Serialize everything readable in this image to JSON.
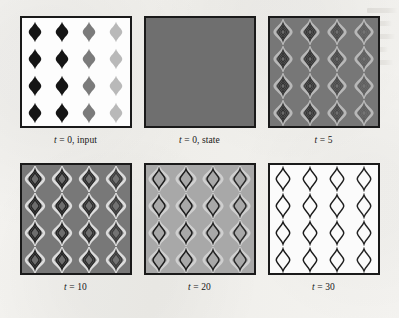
{
  "figure": {
    "kind": "simulation-frame-sequence",
    "grid_columns": 3,
    "grid_rows": 2,
    "cell_grid": {
      "rows": 4,
      "cols": 4
    },
    "page_background": "#f2f1ee",
    "frame_border_color": "#1a1a1a"
  },
  "panels": [
    {
      "id": "panel-t0-input",
      "caption_var": "t",
      "caption_rest": " = 0, input",
      "background": "#fdfdfd",
      "column_fills": [
        "#151515",
        "#151515",
        "#7b7b7b",
        "#b9b9b9"
      ],
      "column_strokes": [
        "#0d0d0d",
        "#0d0d0d",
        "#6e6e6e",
        "#b0b0b0"
      ],
      "halo": "none",
      "stroke_width": 0,
      "shape_scale": 1.0,
      "rings": 1,
      "blank": false
    },
    {
      "id": "panel-t0-state",
      "caption_var": "t",
      "caption_rest": " = 0, state",
      "background": "#6f6f6f",
      "column_fills": [
        "#6f6f6f",
        "#6f6f6f",
        "#6f6f6f",
        "#6f6f6f"
      ],
      "column_strokes": [
        "#6f6f6f",
        "#6f6f6f",
        "#6f6f6f",
        "#6f6f6f"
      ],
      "halo": "none",
      "stroke_width": 0,
      "shape_scale": 0,
      "rings": 0,
      "blank": true
    },
    {
      "id": "panel-t5",
      "caption_var": "t",
      "caption_rest": " = 5",
      "background": "#777777",
      "column_fills": [
        "#6a6a6a",
        "#6a6a6a",
        "#6f6f6f",
        "#747474"
      ],
      "column_strokes": [
        "#333333",
        "#333333",
        "#4a4a4a",
        "#5f5f5f"
      ],
      "halo": "#b8b8b8",
      "stroke_width": 1.1,
      "shape_scale": 0.86,
      "rings": 3,
      "blank": false
    },
    {
      "id": "panel-t10",
      "caption_var": "t",
      "caption_rest": " = 10",
      "background": "#787878",
      "column_fills": [
        "#6d6d6d",
        "#6d6d6d",
        "#6f6f6f",
        "#727272"
      ],
      "column_strokes": [
        "#242424",
        "#242424",
        "#2c2c2c",
        "#3d3d3d"
      ],
      "halo": "#dcdcdc",
      "stroke_width": 1.3,
      "shape_scale": 0.92,
      "rings": 2,
      "blank": false
    },
    {
      "id": "panel-t20",
      "caption_var": "t",
      "caption_rest": " = 20",
      "background": "#a8a8a8",
      "column_fills": [
        "#a8a8a8",
        "#a8a8a8",
        "#a8a8a8",
        "#a8a8a8"
      ],
      "column_strokes": [
        "#1d1d1d",
        "#1d1d1d",
        "#232323",
        "#2a2a2a"
      ],
      "halo": "#cfcfcf",
      "stroke_width": 1.5,
      "shape_scale": 0.96,
      "rings": 1,
      "blank": false
    },
    {
      "id": "panel-t30",
      "caption_var": "t",
      "caption_rest": " = 30",
      "background": "#fbfbfb",
      "column_fills": [
        "#fbfbfb",
        "#fbfbfb",
        "#fbfbfb",
        "#fbfbfb"
      ],
      "column_strokes": [
        "#1a1a1a",
        "#1a1a1a",
        "#1f1f1f",
        "#232323"
      ],
      "halo": "none",
      "stroke_width": 1.4,
      "shape_scale": 1.08,
      "rings": 1,
      "blank": false
    }
  ],
  "chart_data": {
    "type": "heatmap",
    "title": "",
    "xlabel": "",
    "ylabel": "",
    "frames": [
      {
        "label": "t = 0, input",
        "t": 0,
        "background_level": 1.0,
        "cell_levels": [
          [
            0.08,
            0.08,
            0.48,
            0.73
          ],
          [
            0.08,
            0.08,
            0.48,
            0.73
          ],
          [
            0.08,
            0.08,
            0.48,
            0.73
          ],
          [
            0.08,
            0.08,
            0.48,
            0.73
          ]
        ]
      },
      {
        "label": "t = 0, state",
        "t": 0,
        "background_level": 0.44,
        "cell_levels": [
          [
            0.44,
            0.44,
            0.44,
            0.44
          ],
          [
            0.44,
            0.44,
            0.44,
            0.44
          ],
          [
            0.44,
            0.44,
            0.44,
            0.44
          ],
          [
            0.44,
            0.44,
            0.44,
            0.44
          ]
        ]
      },
      {
        "label": "t = 5",
        "t": 5,
        "background_level": 0.47,
        "cell_levels": [
          [
            0.2,
            0.2,
            0.29,
            0.37
          ],
          [
            0.2,
            0.2,
            0.29,
            0.37
          ],
          [
            0.2,
            0.2,
            0.29,
            0.37
          ],
          [
            0.2,
            0.2,
            0.29,
            0.37
          ]
        ]
      },
      {
        "label": "t = 10",
        "t": 10,
        "background_level": 0.47,
        "cell_levels": [
          [
            0.14,
            0.14,
            0.17,
            0.24
          ],
          [
            0.14,
            0.14,
            0.17,
            0.24
          ],
          [
            0.14,
            0.14,
            0.17,
            0.24
          ],
          [
            0.14,
            0.14,
            0.17,
            0.24
          ]
        ]
      },
      {
        "label": "t = 20",
        "t": 20,
        "background_level": 0.66,
        "cell_levels": [
          [
            0.11,
            0.11,
            0.14,
            0.16
          ],
          [
            0.11,
            0.11,
            0.14,
            0.16
          ],
          [
            0.11,
            0.11,
            0.14,
            0.16
          ],
          [
            0.11,
            0.11,
            0.14,
            0.16
          ]
        ]
      },
      {
        "label": "t = 30",
        "t": 30,
        "background_level": 0.98,
        "cell_levels": [
          [
            0.1,
            0.1,
            0.12,
            0.14
          ],
          [
            0.1,
            0.1,
            0.12,
            0.14
          ],
          [
            0.1,
            0.1,
            0.12,
            0.14
          ],
          [
            0.1,
            0.1,
            0.12,
            0.14
          ]
        ]
      }
    ]
  }
}
